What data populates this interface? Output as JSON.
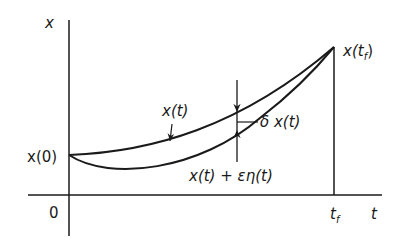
{
  "figure": {
    "axis_labels": {
      "vertical": "x",
      "horizontal": "t",
      "origin": "0",
      "t_final": "t",
      "t_final_sub": "f"
    },
    "point_labels": {
      "start": "x(0)",
      "end_main": "x(t",
      "end_sub": "f",
      "end_close": ")"
    },
    "curve_labels": {
      "nominal": "x(t)",
      "perturbed": "x(t) + εη(t)",
      "variation": "δ x(t)"
    },
    "colors": {
      "ink": "#1a1a1a",
      "background": "#ffffff"
    }
  }
}
